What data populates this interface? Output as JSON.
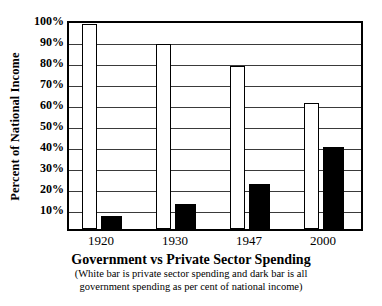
{
  "chart_data": {
    "type": "bar",
    "title": "Government vs Private Sector Spending",
    "caption_lines": [
      "(White bar is private sector spending and dark bar is all",
      "government spending as per cent of national income)"
    ],
    "xlabel": "",
    "ylabel": "Percent of National Income",
    "ylim": [
      0,
      100
    ],
    "ytick_labels": [
      "10%",
      "20%",
      "30%",
      "40%",
      "50%",
      "60%",
      "70%",
      "80%",
      "90%",
      "100%"
    ],
    "ytick_values": [
      10,
      20,
      30,
      40,
      50,
      60,
      70,
      80,
      90,
      100
    ],
    "grid": true,
    "legend": "none",
    "categories": [
      "1920",
      "1930",
      "1947",
      "2000"
    ],
    "series": [
      {
        "name": "Private sector spending",
        "style": "white",
        "values": [
          97.5,
          88,
          77.5,
          60
        ]
      },
      {
        "name": "Government spending",
        "style": "dark",
        "values": [
          6,
          12,
          21.5,
          39
        ]
      }
    ]
  }
}
